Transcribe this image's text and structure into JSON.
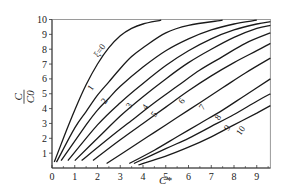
{
  "chart_data": {
    "type": "line",
    "title": "",
    "xlabel": "C*",
    "ylabel": "C/C0",
    "xlim": [
      0,
      9.6
    ],
    "ylim": [
      0,
      10
    ],
    "xticks": [
      "0",
      "1",
      "2",
      "3",
      "4",
      "5",
      "6",
      "7",
      "8",
      "9"
    ],
    "yticks": [
      "1",
      "2",
      "3",
      "4",
      "5",
      "6",
      "7",
      "8",
      "9",
      "10"
    ],
    "y_zero_label": "0",
    "grid": false,
    "legend": "inline curve labels",
    "series": [
      {
        "name": "ξ=0",
        "label": "ξ=0",
        "points": [
          [
            0.1,
            0.4
          ],
          [
            0.5,
            2.0
          ],
          [
            1.0,
            3.9
          ],
          [
            1.5,
            5.6
          ],
          [
            2.0,
            7.0
          ],
          [
            2.5,
            8.1
          ],
          [
            3.0,
            8.9
          ],
          [
            3.5,
            9.4
          ],
          [
            4.0,
            9.7
          ],
          [
            4.8,
            9.95
          ]
        ]
      },
      {
        "name": "1",
        "label": "1",
        "points": [
          [
            0.2,
            0.4
          ],
          [
            1.0,
            2.7
          ],
          [
            1.5,
            3.8
          ],
          [
            2.0,
            4.9
          ],
          [
            2.5,
            5.8
          ],
          [
            3.0,
            6.7
          ],
          [
            3.5,
            7.5
          ],
          [
            4.0,
            8.1
          ],
          [
            5.0,
            9.1
          ],
          [
            6.0,
            9.6
          ],
          [
            7.5,
            9.95
          ]
        ]
      },
      {
        "name": "2",
        "label": "2",
        "points": [
          [
            0.4,
            0.5
          ],
          [
            1.5,
            2.9
          ],
          [
            2.0,
            3.9
          ],
          [
            2.5,
            4.7
          ],
          [
            3.0,
            5.5
          ],
          [
            4.0,
            6.8
          ],
          [
            5.0,
            7.9
          ],
          [
            6.0,
            8.7
          ],
          [
            7.0,
            9.3
          ],
          [
            8.0,
            9.7
          ],
          [
            9.0,
            9.95
          ]
        ]
      },
      {
        "name": "3",
        "label": "3",
        "points": [
          [
            0.7,
            0.5
          ],
          [
            2.0,
            2.9
          ],
          [
            3.0,
            4.4
          ],
          [
            4.0,
            5.7
          ],
          [
            5.0,
            6.9
          ],
          [
            6.0,
            7.9
          ],
          [
            7.0,
            8.7
          ],
          [
            8.0,
            9.3
          ],
          [
            9.0,
            9.7
          ],
          [
            9.6,
            9.85
          ]
        ]
      },
      {
        "name": "4",
        "label": "4",
        "points": [
          [
            1.0,
            0.5
          ],
          [
            2.0,
            2.0
          ],
          [
            3.0,
            3.5
          ],
          [
            4.0,
            4.8
          ],
          [
            5.0,
            6.0
          ],
          [
            6.0,
            7.1
          ],
          [
            7.0,
            8.0
          ],
          [
            8.0,
            8.8
          ],
          [
            9.0,
            9.4
          ],
          [
            9.6,
            9.6
          ]
        ]
      },
      {
        "name": "5",
        "label": "5",
        "points": [
          [
            1.3,
            0.5
          ],
          [
            2.5,
            2.0
          ],
          [
            3.5,
            3.2
          ],
          [
            4.5,
            4.4
          ],
          [
            5.5,
            5.5
          ],
          [
            6.5,
            6.6
          ],
          [
            7.5,
            7.5
          ],
          [
            8.5,
            8.4
          ],
          [
            9.6,
            9.1
          ]
        ]
      },
      {
        "name": "6",
        "label": "6",
        "points": [
          [
            1.8,
            0.5
          ],
          [
            3.0,
            1.9
          ],
          [
            4.0,
            3.0
          ],
          [
            5.0,
            4.1
          ],
          [
            6.0,
            5.2
          ],
          [
            7.0,
            6.2
          ],
          [
            8.0,
            7.1
          ],
          [
            9.0,
            7.9
          ],
          [
            9.6,
            8.4
          ]
        ]
      },
      {
        "name": "7",
        "label": "7",
        "points": [
          [
            2.4,
            0.3
          ],
          [
            3.5,
            1.4
          ],
          [
            4.5,
            2.4
          ],
          [
            5.5,
            3.4
          ],
          [
            6.5,
            4.4
          ],
          [
            7.5,
            5.4
          ],
          [
            8.5,
            6.4
          ],
          [
            9.6,
            7.4
          ]
        ]
      },
      {
        "name": "8",
        "label": "8",
        "points": [
          [
            3.4,
            0.3
          ],
          [
            4.5,
            1.2
          ],
          [
            5.5,
            2.1
          ],
          [
            6.5,
            3.0
          ],
          [
            7.5,
            3.9
          ],
          [
            8.5,
            4.9
          ],
          [
            9.6,
            6.0
          ]
        ]
      },
      {
        "name": "9",
        "label": "9",
        "points": [
          [
            3.6,
            0.3
          ],
          [
            5.0,
            1.3
          ],
          [
            6.0,
            2.0
          ],
          [
            7.0,
            2.8
          ],
          [
            8.0,
            3.6
          ],
          [
            9.0,
            4.5
          ],
          [
            9.6,
            5.0
          ]
        ]
      },
      {
        "name": "10",
        "label": "10",
        "points": [
          [
            3.8,
            0.2
          ],
          [
            5.0,
            0.8
          ],
          [
            6.0,
            1.4
          ],
          [
            7.0,
            2.1
          ],
          [
            8.0,
            2.9
          ],
          [
            9.0,
            3.7
          ],
          [
            9.6,
            4.2
          ]
        ]
      }
    ],
    "label_positions": {
      "ξ=0": [
        2.2,
        7.8
      ],
      "1": [
        1.8,
        5.3
      ],
      "2": [
        2.4,
        4.4
      ],
      "3": [
        3.5,
        4.1
      ],
      "4": [
        4.2,
        4.0
      ],
      "5": [
        4.6,
        3.5
      ],
      "6": [
        5.8,
        4.4
      ],
      "7": [
        6.7,
        4.0
      ],
      "8": [
        7.4,
        3.3
      ],
      "9": [
        7.8,
        2.6
      ],
      "10": [
        8.4,
        2.4
      ]
    }
  }
}
